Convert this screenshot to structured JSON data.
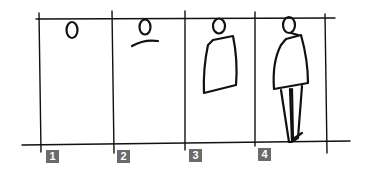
{
  "diagram": {
    "ink_color": "#111111",
    "badge_color": "#6b6b6b",
    "steps": [
      {
        "number": "1",
        "description": "Head oval placed below top line"
      },
      {
        "number": "2",
        "description": "Head with shoulder curve"
      },
      {
        "number": "3",
        "description": "Head with torso/coat block"
      },
      {
        "number": "4",
        "description": "Full figure with legs reaching ground line"
      }
    ]
  }
}
